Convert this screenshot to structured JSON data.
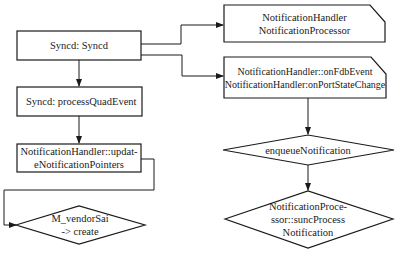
{
  "diagram": {
    "type": "flowchart",
    "nodes": [
      {
        "id": "syncd",
        "shape": "rect",
        "label": "Syncd: Syncd"
      },
      {
        "id": "process_quad",
        "shape": "rect",
        "label": "Syncd: processQuadEvent"
      },
      {
        "id": "update_pointers",
        "shape": "rect",
        "label": "NotificationHandler::updat-\neNotificationPointers"
      },
      {
        "id": "vendor_create",
        "shape": "diamond",
        "label": "M_vendorSai\n-> create"
      },
      {
        "id": "handler_processor",
        "shape": "card",
        "label": "NotificationHandler\nNotificationProcessor"
      },
      {
        "id": "on_events",
        "shape": "card",
        "label": "NotificationHandler::onFdbEvent\nNotificationHandler:onPortStateChange"
      },
      {
        "id": "enqueue",
        "shape": "diamond",
        "label": "enqueueNotification"
      },
      {
        "id": "sync_process",
        "shape": "diamond",
        "label": "NotificationProce-\nssor::suncProcess\nNotification"
      }
    ],
    "edges": [
      {
        "from": "syncd",
        "to": "handler_processor"
      },
      {
        "from": "syncd",
        "to": "on_events"
      },
      {
        "from": "syncd",
        "to": "process_quad"
      },
      {
        "from": "process_quad",
        "to": "update_pointers"
      },
      {
        "from": "update_pointers",
        "to": "vendor_create"
      },
      {
        "from": "on_events",
        "to": "enqueue"
      },
      {
        "from": "enqueue",
        "to": "sync_process"
      }
    ]
  }
}
